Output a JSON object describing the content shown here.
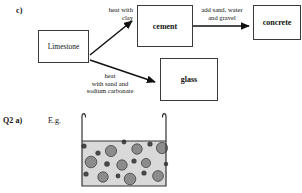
{
  "page": {
    "background_color": "#ffffff",
    "ink_color": "#1a1a1a"
  },
  "part_c": {
    "label": "c)",
    "boxes": [
      {
        "id": "limestone",
        "label": "Limestone",
        "bold": false
      },
      {
        "id": "cement",
        "label": "cement",
        "bold": true
      },
      {
        "id": "concrete",
        "label": "concrete",
        "bold": true
      },
      {
        "id": "glass",
        "label": "glass",
        "bold": true
      }
    ],
    "arrow_labels": {
      "limestone_to_cement": "heat with\nclay",
      "cement_to_concrete": "add sand, water\nand gravel",
      "limestone_to_glass": "heat\nwith sand and\nsodium carbonate"
    },
    "arrow_color": "#111111",
    "box_border_color": "#3a3a3a"
  },
  "question_2a": {
    "label": "Q2 a)",
    "answer_prefix": "E.g.",
    "diagram": {
      "name": "beaker-with-mixture",
      "liquid_fill_color": "#d9d9d9",
      "large_particle_color": "#8c8c8c",
      "small_particle_color": "#474747",
      "outline_color": "#333333",
      "large_particles": [
        {
          "cx": 37,
          "cy": 43,
          "r": 5.6
        },
        {
          "cx": 63,
          "cy": 41,
          "r": 5.2
        },
        {
          "cx": 88,
          "cy": 40,
          "r": 5.6
        },
        {
          "cx": 17,
          "cy": 54,
          "r": 5.8
        },
        {
          "cx": 48,
          "cy": 57,
          "r": 5.2
        },
        {
          "cx": 72,
          "cy": 55,
          "r": 4.6
        },
        {
          "cx": 29,
          "cy": 69,
          "r": 5.2
        },
        {
          "cx": 56,
          "cy": 71,
          "r": 5.8
        },
        {
          "cx": 84,
          "cy": 68,
          "r": 5.4
        }
      ],
      "small_particles": [
        {
          "cx": 10,
          "cy": 38,
          "r": 2.6
        },
        {
          "cx": 24,
          "cy": 45,
          "r": 2.6
        },
        {
          "cx": 50,
          "cy": 34,
          "r": 2.4
        },
        {
          "cx": 76,
          "cy": 36,
          "r": 2.6
        },
        {
          "cx": 33,
          "cy": 56,
          "r": 2.8
        },
        {
          "cx": 60,
          "cy": 53,
          "r": 2.6
        },
        {
          "cx": 12,
          "cy": 66,
          "r": 2.6
        },
        {
          "cx": 44,
          "cy": 68,
          "r": 2.4
        },
        {
          "cx": 70,
          "cy": 65,
          "r": 2.6
        },
        {
          "cx": 92,
          "cy": 56,
          "r": 2.2
        }
      ]
    }
  }
}
